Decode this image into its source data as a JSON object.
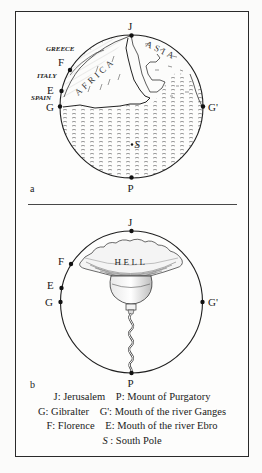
{
  "figure": {
    "panel_a": {
      "label": "a",
      "points": {
        "J": "J",
        "P": "P",
        "G": "G",
        "G_prime": "G'",
        "F": "F",
        "E": "E",
        "S": "S"
      },
      "regions": {
        "greece": "GREECE",
        "italy": "ITALY",
        "spain": "SPAIN"
      },
      "continents": {
        "africa": "AFRICA",
        "asia": "ASIA"
      }
    },
    "panel_b": {
      "label": "b",
      "points": {
        "J": "J",
        "P": "P",
        "G": "G",
        "G_prime": "G'",
        "F": "F",
        "E": "E"
      },
      "hell_label": "HELL"
    }
  },
  "legend": {
    "rows": [
      [
        {
          "key": "J",
          "sep": ": ",
          "text": "Jerusalem"
        },
        {
          "key": "P",
          "sep": ": ",
          "text": "Mount of Purgatory"
        }
      ],
      [
        {
          "key": "G",
          "sep": ": ",
          "text": "Gibralter"
        },
        {
          "key": "G'",
          "sep": ": ",
          "text": "Mouth of the river Ganges"
        }
      ],
      [
        {
          "key": "F",
          "sep": ": ",
          "text": "Florence"
        },
        {
          "key": "E",
          "sep": ": ",
          "text": "Mouth of the river Ebro"
        }
      ],
      [
        {
          "key": "S",
          "sep": " : ",
          "text": "South Pole"
        }
      ]
    ]
  },
  "colors": {
    "ink": "#1a1a1a",
    "paper": "#fdfdfc",
    "frame": "#2a2a2a"
  }
}
